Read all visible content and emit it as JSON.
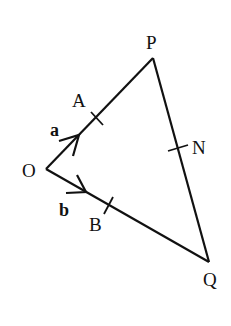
{
  "diagram": {
    "type": "vector-triangle",
    "points": {
      "O": {
        "label": "O",
        "x": 46,
        "y": 169
      },
      "P": {
        "label": "P",
        "x": 153,
        "y": 58
      },
      "Q": {
        "label": "Q",
        "x": 209,
        "y": 262
      },
      "A": {
        "label": "A",
        "x": 96,
        "y": 117
      },
      "B": {
        "label": "B",
        "x": 108,
        "y": 205
      },
      "N": {
        "label": "N",
        "x": 175,
        "y": 148
      }
    },
    "vectors": {
      "a": {
        "label": "a",
        "from": "O",
        "to": "A"
      },
      "b": {
        "label": "b",
        "from": "O",
        "to": "B"
      }
    },
    "segments": [
      "OP",
      "OQ",
      "PQ"
    ],
    "stroke_color": "#111111"
  }
}
